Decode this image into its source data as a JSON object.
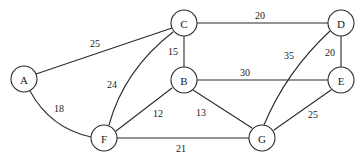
{
  "figure": {
    "kind": "weighted-undirected-graph",
    "background": "#ffffff",
    "stroke_color": "#2b2b2b",
    "text_color": "#1a1a1a",
    "width": 364,
    "height": 162
  },
  "nodes": [
    {
      "id": "A",
      "label": "A",
      "cx": 24,
      "cy": 79,
      "r": 13
    },
    {
      "id": "B",
      "label": "B",
      "cx": 184,
      "cy": 80,
      "r": 13
    },
    {
      "id": "C",
      "label": "C",
      "cx": 184,
      "cy": 23,
      "r": 13
    },
    {
      "id": "D",
      "label": "D",
      "cx": 341,
      "cy": 23,
      "r": 13
    },
    {
      "id": "E",
      "label": "E",
      "cx": 341,
      "cy": 80,
      "r": 13
    },
    {
      "id": "F",
      "label": "F",
      "cx": 104,
      "cy": 138,
      "r": 13
    },
    {
      "id": "G",
      "label": "G",
      "cx": 262,
      "cy": 138,
      "r": 13
    }
  ],
  "edges": [
    {
      "id": "A-C",
      "from": "A",
      "to": "C",
      "weight": "25",
      "label_x": 95,
      "label_y": 43,
      "path": "M 36 74 L 172 28"
    },
    {
      "id": "A-F",
      "from": "A",
      "to": "F",
      "weight": "18",
      "label_x": 59,
      "label_y": 108,
      "path": "M 30 91 Q 50 128 91 137"
    },
    {
      "id": "C-D",
      "from": "C",
      "to": "D",
      "weight": "20",
      "label_x": 260,
      "label_y": 15,
      "path": "M 197 23 L 328 23"
    },
    {
      "id": "C-B",
      "from": "C",
      "to": "B",
      "weight": "15",
      "label_x": 173,
      "label_y": 51,
      "path": "M 184 36 L 184 67"
    },
    {
      "id": "C-F",
      "from": "C",
      "to": "F",
      "weight": "24",
      "label_x": 112,
      "label_y": 84,
      "path": "M 173 32 Q 124 70 109 125"
    },
    {
      "id": "B-E",
      "from": "B",
      "to": "E",
      "weight": "30",
      "label_x": 245,
      "label_y": 72,
      "path": "M 197 80 L 328 80"
    },
    {
      "id": "B-F",
      "from": "B",
      "to": "F",
      "weight": "12",
      "label_x": 158,
      "label_y": 113,
      "path": "M 172 88 L 116 131"
    },
    {
      "id": "B-G",
      "from": "B",
      "to": "G",
      "weight": "13",
      "label_x": 201,
      "label_y": 112,
      "path": "M 193 90 L 252 128"
    },
    {
      "id": "D-E",
      "from": "D",
      "to": "E",
      "weight": "20",
      "label_x": 330,
      "label_y": 52,
      "path": "M 341 36 L 341 67"
    },
    {
      "id": "D-G",
      "from": "D",
      "to": "G",
      "weight": "35",
      "label_x": 289,
      "label_y": 55,
      "path": "M 330 31 Q 286 72 264 125"
    },
    {
      "id": "E-G",
      "from": "E",
      "to": "G",
      "weight": "25",
      "label_x": 313,
      "label_y": 114,
      "path": "M 331 90 L 274 130"
    },
    {
      "id": "F-G",
      "from": "F",
      "to": "G",
      "weight": "21",
      "label_x": 181,
      "label_y": 148,
      "path": "M 117 138 L 249 138"
    }
  ]
}
